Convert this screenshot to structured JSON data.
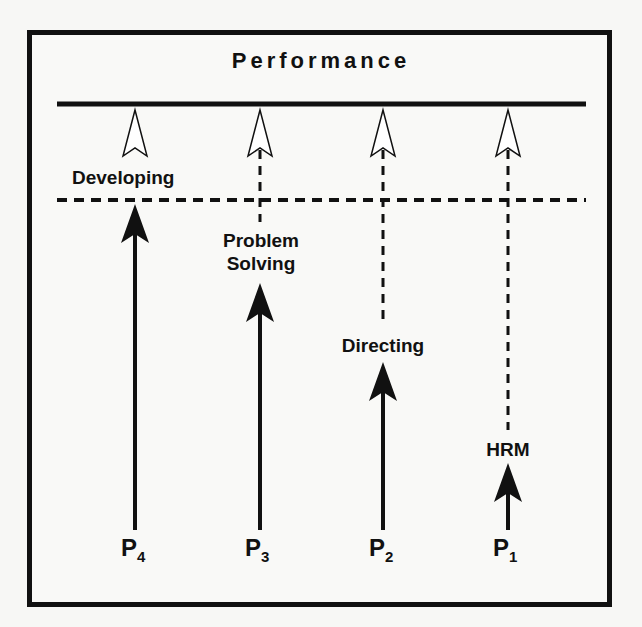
{
  "title": "Performance",
  "stages": {
    "developing": "Developing",
    "problem_solving_1": "Problem",
    "problem_solving_2": "Solving",
    "directing": "Directing",
    "hrm": "HRM"
  },
  "positions": [
    {
      "letter": "P",
      "sub": "4",
      "stage": "Developing"
    },
    {
      "letter": "P",
      "sub": "3",
      "stage": "Problem Solving"
    },
    {
      "letter": "P",
      "sub": "2",
      "stage": "Directing"
    },
    {
      "letter": "P",
      "sub": "1",
      "stage": "HRM"
    }
  ],
  "colors": {
    "ink": "#111111",
    "background": "#f9f9f7"
  }
}
